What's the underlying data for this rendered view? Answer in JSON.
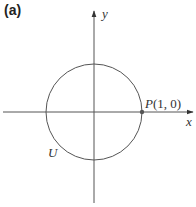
{
  "figure": {
    "panel_label": "(a)",
    "x_axis_label": "x",
    "y_axis_label": "y",
    "circle_label": "U",
    "point": {
      "name": "P",
      "coords_text": "(1, 0)",
      "x": 1,
      "y": 0
    },
    "colors": {
      "line": "#555555",
      "text": "#333333",
      "point": "#555555"
    }
  }
}
